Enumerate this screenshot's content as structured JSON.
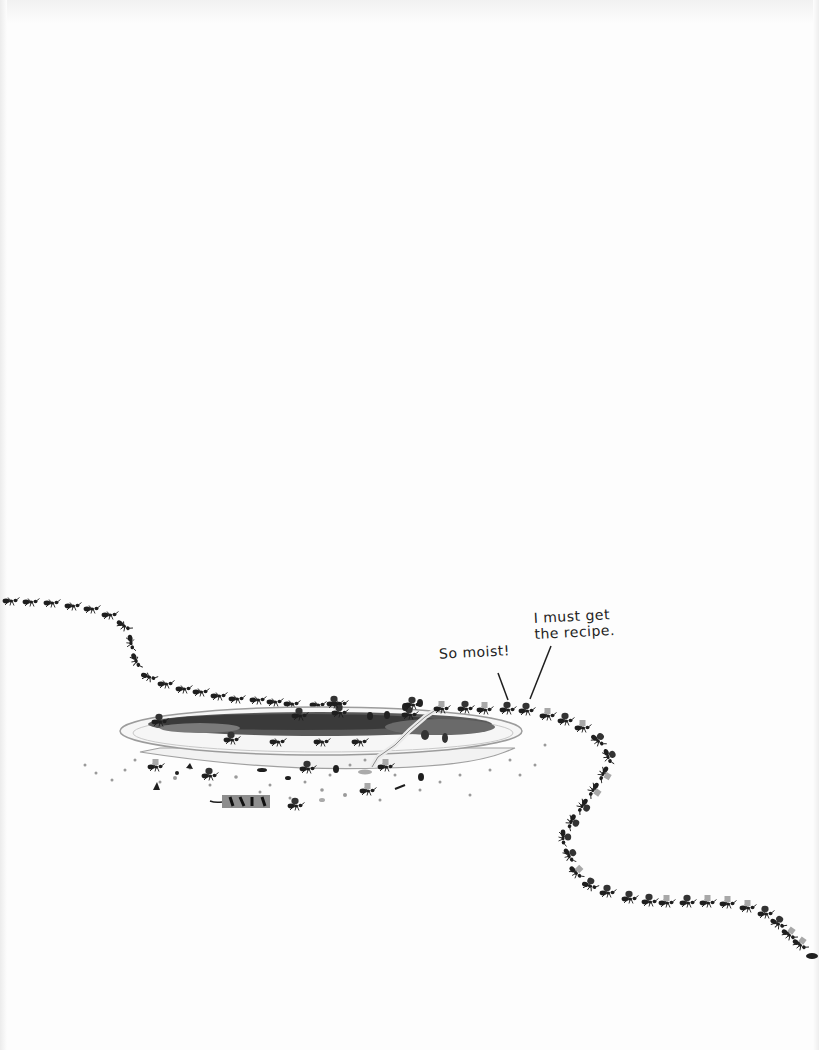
{
  "page": {
    "background": "#fdfdfd",
    "ink_color": "#1e1e1e",
    "crumb_color": "#9a9a9a"
  },
  "illustration": {
    "subject": "ant trail leading to a cake plate",
    "plate": {
      "color": "#f4f4f4",
      "outline": "#9c9c9c",
      "cake_color": "#4a4a4a"
    },
    "cake_bar": {
      "color": "#8e8e8e",
      "stripe_color": "#111111"
    }
  },
  "speech": {
    "bubble_1": {
      "text": "So moist!"
    },
    "bubble_2": {
      "line_1": "I must get",
      "line_2": "the recipe."
    }
  }
}
